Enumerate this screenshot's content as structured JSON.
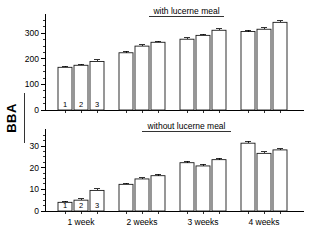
{
  "chart_data": {
    "type": "bar",
    "title": "",
    "ylabel": "BBA",
    "xlabel": "",
    "categories": [
      "1 week",
      "2 weeks",
      "3 weeks",
      "4 weeks"
    ],
    "bar_numbers": [
      "1",
      "2",
      "3"
    ],
    "panels": [
      {
        "title": "with lucerne meal",
        "ylim": [
          0,
          360
        ],
        "yticks": [
          0,
          100,
          200,
          300
        ],
        "ytick_labels": [
          "0",
          "100",
          "200",
          "300"
        ],
        "minor_tick_step": 25,
        "grid": false,
        "series": [
          {
            "name": "1",
            "values": [
              167,
              224,
              277,
              307
            ],
            "errors": [
              5,
              6,
              6,
              5
            ]
          },
          {
            "name": "2",
            "values": [
              175,
              250,
              292,
              316
            ],
            "errors": [
              5,
              5,
              5,
              5
            ]
          },
          {
            "name": "3",
            "values": [
              190,
              265,
              312,
              343
            ],
            "errors": [
              6,
              5,
              6,
              6
            ]
          }
        ]
      },
      {
        "title": "without lucerne meal",
        "ylim": [
          0,
          36
        ],
        "yticks": [
          0,
          10,
          20,
          30
        ],
        "ytick_labels": [
          "0",
          "10",
          "20",
          "30"
        ],
        "minor_tick_step": 2.5,
        "grid": false,
        "series": [
          {
            "name": "1",
            "values": [
              4.0,
              12.3,
              22.3,
              31.3
            ],
            "errors": [
              0.6,
              0.6,
              0.7,
              0.8
            ]
          },
          {
            "name": "2",
            "values": [
              5.0,
              14.8,
              20.8,
              26.6
            ],
            "errors": [
              0.7,
              0.6,
              0.7,
              0.7
            ]
          },
          {
            "name": "3",
            "values": [
              9.5,
              16.3,
              23.7,
              28.2
            ],
            "errors": [
              0.8,
              0.6,
              0.6,
              0.6
            ]
          }
        ]
      }
    ],
    "legend": [],
    "legend_position": "none"
  }
}
